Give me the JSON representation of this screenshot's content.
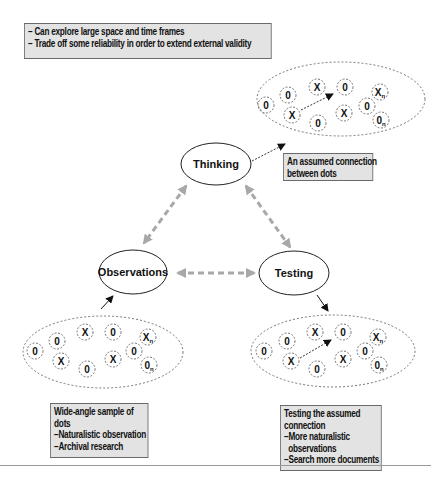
{
  "top_note": {
    "lines": [
      "– Can explore large space and time frames",
      "– Trade off some reliability in order to extend external validity"
    ]
  },
  "nodes": {
    "thinking": "Thinking",
    "observations": "Observations",
    "testing": "Testing"
  },
  "clusters": {
    "symbols": [
      "0",
      "0",
      "X",
      "0",
      "X<sub>n</sub>",
      "0",
      "X",
      "0",
      "X",
      "0",
      "0<sub>n</sub>"
    ]
  },
  "callouts": {
    "thinking": [
      "An assumed connection",
      "between dots"
    ],
    "observations": [
      "Wide-angle sample of",
      "dots",
      "–Naturalistic observation",
      "–Archival research"
    ],
    "testing": [
      "Testing the assumed",
      "connection",
      "–More naturalistic",
      " observations",
      "–Search more documents"
    ]
  },
  "colors": {
    "callout_bg": "#e3e3e3",
    "dashed_arrow": "#a8a8a8",
    "ink": "#111111"
  }
}
